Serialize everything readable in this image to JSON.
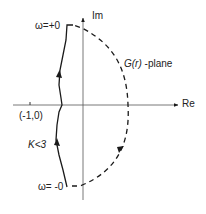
{
  "diagram": {
    "type": "nyquist-plot",
    "axes": {
      "real_label": "Re",
      "imag_label": "Im"
    },
    "critical_point_label": "(-1,0)",
    "plane_label_func": "G(r)",
    "plane_label_suffix": " -plane",
    "gain_condition": "K<3",
    "omega_top_label": "ω=+0",
    "omega_bottom_label": "ω= -0",
    "colors": {
      "line": "#1a1a1a",
      "background": "#ffffff"
    }
  }
}
